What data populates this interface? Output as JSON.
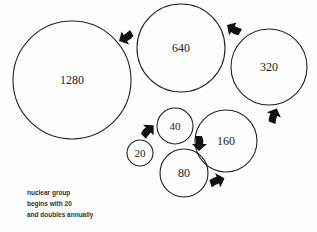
{
  "diagram": {
    "type": "growth-cycle",
    "circles": [
      {
        "label": "20",
        "cx": 140,
        "cy": 153,
        "r": 13,
        "font": 11
      },
      {
        "label": "40",
        "cx": 175,
        "cy": 126,
        "r": 18,
        "font": 11
      },
      {
        "label": "80",
        "cx": 184,
        "cy": 173,
        "r": 24,
        "font": 12
      },
      {
        "label": "160",
        "cx": 226,
        "cy": 141,
        "r": 31,
        "font": 12
      },
      {
        "label": "320",
        "cx": 269,
        "cy": 67,
        "r": 38,
        "font": 12
      },
      {
        "label": "640",
        "cx": 181,
        "cy": 48,
        "r": 44,
        "font": 12
      },
      {
        "label": "1280",
        "cx": 72,
        "cy": 80,
        "r": 59,
        "font": 12
      }
    ],
    "arrows": [
      {
        "from": "20",
        "to": "40",
        "x": 148,
        "y": 131,
        "angle": -45
      },
      {
        "from": "40",
        "to": "80",
        "x": 199,
        "y": 143,
        "angle": 90
      },
      {
        "from": "80",
        "to": "160",
        "x": 217,
        "y": 181,
        "angle": -20
      },
      {
        "from": "160",
        "to": "320",
        "x": 274,
        "y": 116,
        "angle": -70
      },
      {
        "from": "320",
        "to": "640",
        "x": 234,
        "y": 29,
        "angle": 210
      },
      {
        "from": "640",
        "to": "1280",
        "x": 126,
        "y": 37,
        "angle": 150
      }
    ],
    "caption": {
      "lines": [
        "nuclear group",
        "begins with 20",
        "and doubles annually"
      ]
    }
  }
}
